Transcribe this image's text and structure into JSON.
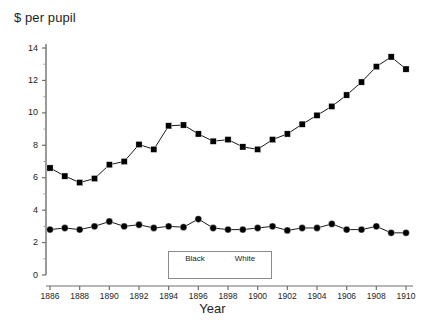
{
  "chart_data": {
    "type": "line",
    "title": "",
    "xlabel": "Year",
    "ylabel": "$ per pupil",
    "xlim": [
      1886,
      1910
    ],
    "ylim": [
      0,
      15
    ],
    "grid": false,
    "legend_position": "bottom-center",
    "y_ticks": [
      "0",
      "2",
      "4",
      "6",
      "8",
      "10",
      "12",
      "14"
    ],
    "y_tick_values": [
      0,
      2,
      4,
      6,
      8,
      10,
      12,
      14
    ],
    "x_ticks": [
      "1886",
      "1888",
      "1890",
      "1892",
      "1894",
      "1896",
      "1898",
      "1900",
      "1902",
      "1904",
      "1906",
      "1908",
      "1910"
    ],
    "x_tick_values": [
      1886,
      1888,
      1890,
      1892,
      1894,
      1896,
      1898,
      1900,
      1902,
      1904,
      1906,
      1908,
      1910
    ],
    "x": [
      1886,
      1887,
      1888,
      1889,
      1890,
      1891,
      1892,
      1893,
      1894,
      1895,
      1896,
      1897,
      1898,
      1899,
      1900,
      1901,
      1902,
      1903,
      1904,
      1905,
      1906,
      1907,
      1908,
      1909,
      1910
    ],
    "series": [
      {
        "name": "Black",
        "marker": "circle",
        "color": "#000000",
        "values": [
          2.8,
          2.9,
          2.8,
          3.0,
          3.3,
          3.0,
          3.1,
          2.9,
          3.0,
          2.95,
          3.45,
          2.9,
          2.8,
          2.8,
          2.9,
          3.0,
          2.75,
          2.9,
          2.9,
          3.15,
          2.8,
          2.8,
          3.0,
          2.6,
          2.6
        ]
      },
      {
        "name": "White",
        "marker": "square",
        "color": "#000000",
        "values": [
          6.6,
          6.1,
          5.7,
          5.95,
          6.8,
          7.0,
          8.05,
          7.75,
          9.2,
          9.25,
          8.7,
          8.25,
          8.35,
          7.9,
          7.75,
          8.35,
          8.7,
          9.3,
          9.85,
          10.4,
          11.1,
          11.9,
          12.85,
          13.45,
          12.7
        ]
      }
    ]
  },
  "axes": {
    "y_title": "$ per pupil",
    "x_title": "Year"
  },
  "legend": {
    "items": [
      {
        "label": "Black",
        "marker": "circle"
      },
      {
        "label": "White",
        "marker": "square"
      }
    ]
  }
}
